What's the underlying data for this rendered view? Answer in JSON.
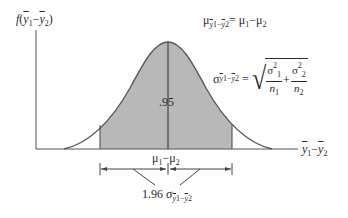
{
  "diagram": {
    "type": "sampling-distribution-normal-curve",
    "y_axis_label": "f(ȳ1−ȳ2)",
    "x_axis_label": "ȳ1−ȳ2",
    "mean_formula": {
      "lhs_symbol": "μ",
      "lhs_subscript": "ȳ1−ȳ2",
      "equals": "=",
      "rhs": "μ1−μ2"
    },
    "sd_formula": {
      "lhs_symbol": "σ",
      "lhs_subscript": "ȳ1−ȳ2",
      "equals": "=",
      "term1_num": "σ1²",
      "term1_den": "n1",
      "plus": "+",
      "term2_num": "σ2²",
      "term2_den": "n2"
    },
    "shaded_area_label": ".95",
    "center_label": "μ1−μ2",
    "interval_label_coef": "1.96",
    "interval_label_symbol": "σ",
    "interval_label_subscript": "ȳ1−ȳ2",
    "colors": {
      "shade": "#b8b8b8",
      "line": "#444444",
      "text": "#2a2a2a"
    }
  }
}
